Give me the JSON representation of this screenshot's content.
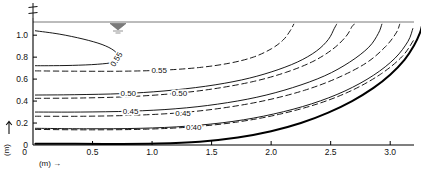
{
  "figure": {
    "name": "contour-plot-velocity-distribution",
    "centerline_symbol": "℄",
    "water_level_symbol": "water-level-triangle"
  },
  "axes": {
    "x": {
      "label": "(m)",
      "arrow": "→",
      "ticks": [
        {
          "value": 0,
          "text": "0"
        },
        {
          "value": 0.5,
          "text": "0.5"
        },
        {
          "value": 1.0,
          "text": "1.0"
        },
        {
          "value": 1.5,
          "text": "1.5"
        },
        {
          "value": 2.0,
          "text": "2.0"
        },
        {
          "value": 2.5,
          "text": "2.5"
        },
        {
          "value": 3.0,
          "text": "3.0"
        }
      ],
      "range": [
        0,
        3.2
      ]
    },
    "y": {
      "label": "(m)",
      "arrow": "↑",
      "ticks": [
        {
          "value": 0,
          "text": "0"
        },
        {
          "value": 0.2,
          "text": "0.2"
        },
        {
          "value": 0.4,
          "text": "0.4"
        },
        {
          "value": 0.6,
          "text": "0.6"
        },
        {
          "value": 0.8,
          "text": "0.8"
        },
        {
          "value": 1.0,
          "text": "1.0"
        }
      ],
      "range": [
        0,
        1.12
      ]
    }
  },
  "chart_data": {
    "type": "line",
    "title": "",
    "xlabel": "(m)",
    "ylabel": "(m)",
    "xlim": [
      0,
      3.2
    ],
    "ylim": [
      0,
      1.12
    ],
    "grid": false,
    "legend": "none",
    "series": [
      {
        "name": "0.55-solid-loop",
        "level": 0.55,
        "style": "solid",
        "label": "0.55",
        "points": [
          [
            0.02,
            1.04
          ],
          [
            0.22,
            1.01
          ],
          [
            0.42,
            0.965
          ],
          [
            0.58,
            0.915
          ],
          [
            0.68,
            0.86
          ],
          [
            0.72,
            0.8
          ],
          [
            0.68,
            0.755
          ],
          [
            0.54,
            0.735
          ],
          [
            0.33,
            0.725
          ],
          [
            0.13,
            0.722
          ],
          [
            0.02,
            0.722
          ]
        ]
      },
      {
        "name": "0.55-dashed",
        "level": 0.55,
        "style": "dashed",
        "label": "0.55",
        "points": [
          [
            0.02,
            0.675
          ],
          [
            0.35,
            0.672
          ],
          [
            0.75,
            0.672
          ],
          [
            1.1,
            0.682
          ],
          [
            1.4,
            0.706
          ],
          [
            1.65,
            0.745
          ],
          [
            1.85,
            0.8
          ],
          [
            2.0,
            0.875
          ],
          [
            2.1,
            0.955
          ],
          [
            2.16,
            1.04
          ],
          [
            2.19,
            1.1
          ]
        ]
      },
      {
        "name": "0.50-solid",
        "level": 0.5,
        "style": "solid",
        "label": "0.50",
        "points": [
          [
            0.02,
            0.455
          ],
          [
            0.35,
            0.458
          ],
          [
            0.75,
            0.468
          ],
          [
            1.1,
            0.492
          ],
          [
            1.45,
            0.535
          ],
          [
            1.75,
            0.592
          ],
          [
            2.0,
            0.665
          ],
          [
            2.22,
            0.755
          ],
          [
            2.38,
            0.855
          ],
          [
            2.48,
            0.96
          ],
          [
            2.53,
            1.06
          ],
          [
            2.55,
            1.1
          ]
        ]
      },
      {
        "name": "0.50-dashed",
        "level": 0.5,
        "style": "dashed",
        "label": "0.50",
        "points": [
          [
            0.02,
            0.425
          ],
          [
            0.4,
            0.428
          ],
          [
            0.8,
            0.44
          ],
          [
            1.18,
            0.468
          ],
          [
            1.52,
            0.512
          ],
          [
            1.85,
            0.578
          ],
          [
            2.12,
            0.66
          ],
          [
            2.35,
            0.76
          ],
          [
            2.52,
            0.875
          ],
          [
            2.63,
            0.99
          ],
          [
            2.68,
            1.08
          ],
          [
            2.7,
            1.1
          ]
        ]
      },
      {
        "name": "0.45-solid",
        "level": 0.45,
        "style": "solid",
        "label": "0.45",
        "points": [
          [
            0.02,
            0.3
          ],
          [
            0.4,
            0.3
          ],
          [
            0.82,
            0.308
          ],
          [
            1.2,
            0.33
          ],
          [
            1.55,
            0.372
          ],
          [
            1.88,
            0.435
          ],
          [
            2.18,
            0.522
          ],
          [
            2.45,
            0.63
          ],
          [
            2.66,
            0.755
          ],
          [
            2.82,
            0.89
          ],
          [
            2.9,
            1.015
          ],
          [
            2.93,
            1.1
          ]
        ]
      },
      {
        "name": "0.45-dashed",
        "level": 0.45,
        "style": "dashed",
        "label": "0.45",
        "points": [
          [
            0.02,
            0.262
          ],
          [
            0.45,
            0.262
          ],
          [
            0.88,
            0.272
          ],
          [
            1.25,
            0.295
          ],
          [
            1.6,
            0.338
          ],
          [
            1.95,
            0.405
          ],
          [
            2.28,
            0.498
          ],
          [
            2.56,
            0.612
          ],
          [
            2.8,
            0.748
          ],
          [
            2.96,
            0.895
          ],
          [
            3.05,
            1.02
          ],
          [
            3.08,
            1.1
          ]
        ]
      },
      {
        "name": "0.40-solid",
        "level": 0.4,
        "style": "solid",
        "label": "0.40",
        "points": [
          [
            0.02,
            0.152
          ],
          [
            0.45,
            0.148
          ],
          [
            0.9,
            0.152
          ],
          [
            1.3,
            0.172
          ],
          [
            1.68,
            0.215
          ],
          [
            2.02,
            0.282
          ],
          [
            2.34,
            0.375
          ],
          [
            2.62,
            0.492
          ],
          [
            2.86,
            0.635
          ],
          [
            3.04,
            0.79
          ],
          [
            3.15,
            0.945
          ],
          [
            3.19,
            1.06
          ]
        ]
      },
      {
        "name": "0.40-dashed",
        "level": 0.4,
        "style": "dashed",
        "label": "",
        "points": [
          [
            0.02,
            0.142
          ],
          [
            0.48,
            0.138
          ],
          [
            0.95,
            0.144
          ],
          [
            1.35,
            0.166
          ],
          [
            1.72,
            0.21
          ],
          [
            2.07,
            0.28
          ],
          [
            2.4,
            0.378
          ],
          [
            2.68,
            0.498
          ],
          [
            2.92,
            0.645
          ],
          [
            3.1,
            0.805
          ],
          [
            3.2,
            0.96
          ]
        ]
      },
      {
        "name": "channel-bed-boundary",
        "level": null,
        "style": "thick-solid",
        "label": "",
        "points": [
          [
            0.02,
            0.012
          ],
          [
            0.6,
            0.01
          ],
          [
            1.05,
            0.014
          ],
          [
            1.4,
            0.03
          ],
          [
            1.72,
            0.068
          ],
          [
            2.0,
            0.125
          ],
          [
            2.25,
            0.2
          ],
          [
            2.48,
            0.295
          ],
          [
            2.68,
            0.4
          ],
          [
            2.86,
            0.52
          ],
          [
            3.0,
            0.64
          ],
          [
            3.12,
            0.775
          ],
          [
            3.2,
            0.905
          ],
          [
            3.25,
            1.02
          ],
          [
            3.27,
            1.1
          ]
        ]
      }
    ],
    "contour_labels": [
      {
        "text": "0.55",
        "x": 0.72,
        "y": 0.795,
        "rotation": -58
      },
      {
        "text": "0.55",
        "x": 1.06,
        "y": 0.68,
        "rotation": 0
      },
      {
        "text": "0.50",
        "x": 0.8,
        "y": 0.47,
        "rotation": 0
      },
      {
        "text": "0.50",
        "x": 1.23,
        "y": 0.47,
        "rotation": 0
      },
      {
        "text": "0.45",
        "x": 0.82,
        "y": 0.31,
        "rotation": 0
      },
      {
        "text": "0.45",
        "x": 1.26,
        "y": 0.295,
        "rotation": 0
      },
      {
        "text": "0.40",
        "x": 1.35,
        "y": 0.165,
        "rotation": 0
      }
    ]
  }
}
